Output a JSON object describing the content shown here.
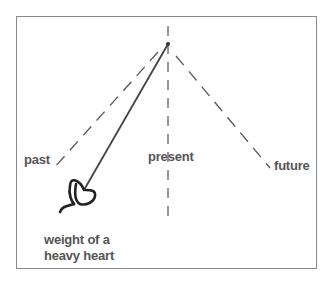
{
  "diagram": {
    "labels": {
      "past": "past",
      "present": "present",
      "future": "future",
      "heart_line1": "weight of a",
      "heart_line2": "heavy heart"
    },
    "colors": {
      "line": "#444444",
      "text": "#555555",
      "border": "#8a8a8a"
    },
    "icons": {
      "heart": "heart-icon"
    }
  }
}
